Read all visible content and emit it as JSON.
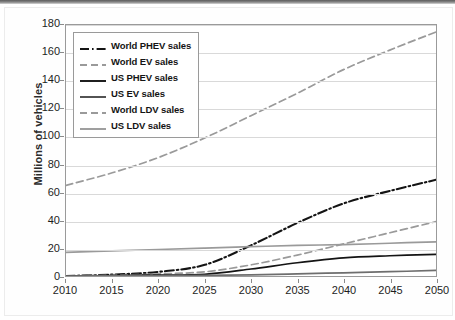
{
  "figure": {
    "ylabel": "Millions of vehicles",
    "yticks": [
      0,
      20,
      40,
      60,
      80,
      100,
      120,
      140,
      160,
      180
    ],
    "xticks": [
      2010,
      2015,
      2020,
      2025,
      2030,
      2035,
      2040,
      2045,
      2050
    ]
  },
  "legend": {
    "items": [
      {
        "label": "World PHEV sales",
        "style": "dash-dot",
        "color": "#141414"
      },
      {
        "label": "World EV sales",
        "style": "dashed",
        "color": "#9a9a9a"
      },
      {
        "label": "US PHEV sales",
        "style": "solid",
        "color": "#141414"
      },
      {
        "label": "US EV sales",
        "style": "solid",
        "color": "#4a4a4a"
      },
      {
        "label": "World LDV sales",
        "style": "dashed",
        "color": "#9a9a9a"
      },
      {
        "label": "US LDV sales",
        "style": "solid",
        "color": "#9a9a9a"
      }
    ]
  },
  "chart_data": {
    "type": "line",
    "title": "",
    "xlabel": "",
    "ylabel": "Millions of vehicles",
    "xlim": [
      2010,
      2050
    ],
    "ylim": [
      0,
      180
    ],
    "grid": true,
    "legend_position": "upper-left",
    "x": [
      2010,
      2015,
      2020,
      2025,
      2030,
      2035,
      2040,
      2045,
      2050
    ],
    "series": [
      {
        "name": "World LDV sales",
        "style": "dashed",
        "color": "#9a9a9a",
        "values": [
          65,
          74,
          85,
          99,
          115,
          131,
          148,
          162,
          175
        ]
      },
      {
        "name": "World PHEV sales",
        "style": "dash-dot",
        "color": "#141414",
        "values": [
          0,
          1,
          3,
          8,
          22,
          38,
          52,
          61,
          69
        ]
      },
      {
        "name": "World EV sales",
        "style": "dashed",
        "color": "#9a9a9a",
        "values": [
          0,
          0.5,
          1.5,
          3,
          8,
          15,
          23,
          31,
          39
        ]
      },
      {
        "name": "US LDV sales",
        "style": "solid",
        "color": "#9a9a9a",
        "values": [
          17,
          18,
          19,
          20,
          21,
          22,
          22.5,
          23.5,
          24.5
        ]
      },
      {
        "name": "US PHEV sales",
        "style": "solid",
        "color": "#141414",
        "values": [
          0,
          0.3,
          0.6,
          1.2,
          5,
          9.5,
          13,
          14.5,
          15.5
        ]
      },
      {
        "name": "US EV sales",
        "style": "solid",
        "color": "#6e6e6e",
        "values": [
          0,
          0.1,
          0.2,
          0.4,
          0.8,
          1.5,
          2.3,
          3.1,
          4
        ]
      }
    ]
  }
}
